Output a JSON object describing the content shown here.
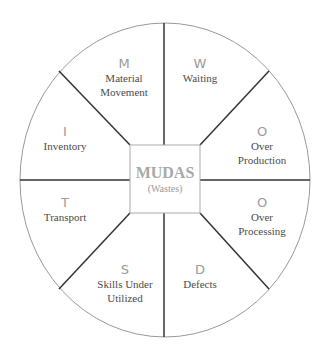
{
  "center": {
    "title": "MUDAS",
    "subtitle": "(Wastes)"
  },
  "segments": [
    {
      "letter": "M",
      "label1": "Material",
      "label2": "Movement"
    },
    {
      "letter": "W",
      "label1": "Waiting",
      "label2": ""
    },
    {
      "letter": "O",
      "label1": "Over",
      "label2": "Production"
    },
    {
      "letter": "O",
      "label1": "Over",
      "label2": "Processing"
    },
    {
      "letter": "D",
      "label1": "Defects",
      "label2": ""
    },
    {
      "letter": "S",
      "label1": "Skills Under",
      "label2": "Utilized"
    },
    {
      "letter": "T",
      "label1": "Transport",
      "label2": ""
    },
    {
      "letter": "I",
      "label1": "Inventory",
      "label2": ""
    }
  ]
}
